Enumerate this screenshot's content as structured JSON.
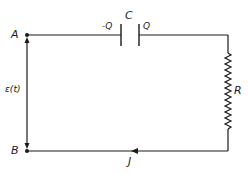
{
  "diagram": {
    "type": "circuit",
    "stroke_color": "#1a1a1a",
    "nodes": {
      "A": {
        "label": "A"
      },
      "B": {
        "label": "B"
      }
    },
    "source": {
      "label": "ε(t)"
    },
    "capacitor": {
      "label": "C",
      "left_plate_charge": "-Q",
      "right_plate_charge": "Q"
    },
    "resistor": {
      "label": "R"
    },
    "current": {
      "label": "J"
    }
  }
}
